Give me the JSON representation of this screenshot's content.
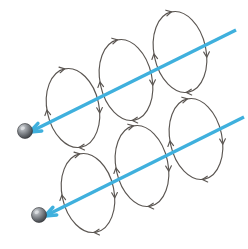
{
  "figure": {
    "background_color": "#ffffff",
    "width": 248,
    "height": 249
  },
  "colors": {
    "ray_blue": "#3fb0dd",
    "loop_stroke": "#5b5652",
    "sphere_dark": "#4e5054",
    "sphere_mid": "#83878c",
    "sphere_light": "#c9ccd0",
    "sphere_edge": "#2f3134"
  },
  "rays": [
    {
      "name": "upper-ray",
      "label": "upper propagation ray",
      "start": {
        "x": 30,
        "y": 132
      },
      "end": {
        "x": 236,
        "y": 30
      },
      "direction": "points down-left toward sphere",
      "stroke_width": 3.4,
      "color": "#3fb0dd"
    },
    {
      "name": "lower-ray",
      "label": "lower propagation ray",
      "start": {
        "x": 45,
        "y": 216
      },
      "end": {
        "x": 244,
        "y": 117
      },
      "direction": "points down-left toward sphere",
      "stroke_width": 3.4,
      "color": "#3fb0dd"
    }
  ],
  "spheres": [
    {
      "name": "upper-particle",
      "label": "charged particle",
      "cx": 25,
      "cy": 131,
      "r": 7.5
    },
    {
      "name": "lower-particle",
      "label": "charged particle",
      "cx": 39,
      "cy": 215,
      "r": 7.5
    }
  ],
  "loops": [
    {
      "name": "upper-loop-1",
      "row": "upper",
      "index": 1,
      "cx": 73,
      "cy": 108,
      "rx": 26,
      "ry": 40,
      "rotation": -12,
      "arrow_angles": [
        15,
        95,
        185,
        270
      ]
    },
    {
      "name": "upper-loop-2",
      "row": "upper",
      "index": 2,
      "cx": 126,
      "cy": 80,
      "rx": 26,
      "ry": 41,
      "rotation": -12,
      "arrow_angles": [
        15,
        95,
        185,
        270
      ]
    },
    {
      "name": "upper-loop-3",
      "row": "upper",
      "index": 3,
      "cx": 180,
      "cy": 52,
      "rx": 26,
      "ry": 41,
      "rotation": -12,
      "arrow_angles": [
        15,
        95,
        185,
        270
      ]
    },
    {
      "name": "lower-loop-1",
      "row": "lower",
      "index": 1,
      "cx": 88,
      "cy": 193,
      "rx": 26,
      "ry": 40,
      "rotation": -12,
      "arrow_angles": [
        15,
        95,
        185,
        270
      ]
    },
    {
      "name": "lower-loop-2",
      "row": "lower",
      "index": 2,
      "cx": 142,
      "cy": 166,
      "rx": 26,
      "ry": 41,
      "rotation": -12,
      "arrow_angles": [
        15,
        95,
        185,
        270
      ]
    },
    {
      "name": "lower-loop-3",
      "row": "lower",
      "index": 3,
      "cx": 196,
      "cy": 139,
      "rx": 26,
      "ry": 41,
      "rotation": -12,
      "arrow_angles": [
        15,
        95,
        185,
        270
      ]
    }
  ],
  "chart_data": {
    "type": "diagram",
    "elements": {
      "ray_count": 2,
      "loops_per_ray": 3,
      "sphere_count": 2
    },
    "annotations": []
  }
}
